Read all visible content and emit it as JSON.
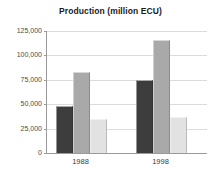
{
  "chart_data": {
    "type": "bar",
    "title": "Production (million ECU)",
    "xlabel": "",
    "ylabel": "",
    "categories": [
      "1988",
      "1998"
    ],
    "series": [
      {
        "name": "series-1",
        "color": "#3d3d3d",
        "values": [
          48000,
          75000
        ]
      },
      {
        "name": "series-2",
        "color": "#a9a9a9",
        "values": [
          83000,
          116000
        ]
      },
      {
        "name": "series-3",
        "color": "#e2e2e2",
        "values": [
          35000,
          36500
        ]
      }
    ],
    "ylim": [
      0,
      125000
    ],
    "yticks": [
      0,
      25000,
      50000,
      75000,
      100000,
      125000
    ],
    "ytick_labels": [
      "0",
      "25,000",
      "50,000",
      "75,000",
      "100,000",
      "125,000"
    ],
    "grid": true,
    "legend": "none"
  },
  "colors": {
    "gridline": "#dcdcdc",
    "axis": "#9a9a9a",
    "title_text": "#1a1a1a",
    "tick_text": "#4a4a4a",
    "background": "#ffffff"
  }
}
